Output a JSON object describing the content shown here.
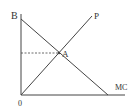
{
  "diagram": {
    "labels": {
      "b": "B",
      "p": "P",
      "a": "A",
      "mc": "MC",
      "origin": "0"
    },
    "colors": {
      "line": "#444444",
      "text": "#333333",
      "background": "#ffffff"
    },
    "lines": [
      {
        "name": "vertical-axis",
        "from": [
          21,
          14
        ],
        "to": [
          21,
          95
        ]
      },
      {
        "name": "horizontal-axis-mc",
        "from": [
          21,
          95
        ],
        "to": [
          125,
          95
        ]
      },
      {
        "name": "line-ba",
        "from": [
          21,
          19
        ],
        "to": [
          108,
          95
        ]
      },
      {
        "name": "line-p",
        "from": [
          21,
          95
        ],
        "to": [
          92,
          16
        ]
      },
      {
        "name": "dashed-guide",
        "from": [
          21,
          53
        ],
        "to": [
          59,
          53
        ],
        "dashed": true
      }
    ],
    "points": {
      "a": [
        59,
        53
      ]
    }
  }
}
